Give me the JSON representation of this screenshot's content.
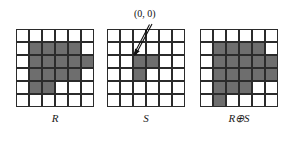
{
  "figure": {
    "background_color": "#ffffff",
    "fill_color": "#6e6e6e",
    "empty_color": "#ffffff",
    "line_color": "#2b2b2b",
    "cell_size": 13,
    "grid_rows": 6,
    "grid_cols": 6
  },
  "annotation": {
    "origin_text": "(0, 0)",
    "arrow_from_x": 152,
    "arrow_from_y": 24,
    "arrow_to_x": 134,
    "arrow_to_y": 56
  },
  "panels": [
    {
      "id": "panel-R",
      "label": "R",
      "left": 16,
      "top": 29,
      "grid": [
        [
          0,
          0,
          0,
          0,
          0,
          0
        ],
        [
          0,
          1,
          1,
          1,
          1,
          0
        ],
        [
          0,
          1,
          1,
          1,
          1,
          1
        ],
        [
          0,
          1,
          1,
          1,
          1,
          0
        ],
        [
          0,
          1,
          1,
          0,
          0,
          0
        ],
        [
          0,
          0,
          0,
          0,
          0,
          0
        ]
      ]
    },
    {
      "id": "panel-S",
      "label": "S",
      "left": 107,
      "top": 29,
      "grid": [
        [
          0,
          0,
          0,
          0,
          0,
          0
        ],
        [
          0,
          0,
          0,
          0,
          0,
          0
        ],
        [
          0,
          0,
          1,
          1,
          0,
          0
        ],
        [
          0,
          0,
          1,
          0,
          0,
          0
        ],
        [
          0,
          0,
          0,
          0,
          0,
          0
        ],
        [
          0,
          0,
          0,
          0,
          0,
          0
        ]
      ]
    },
    {
      "id": "panel-RS",
      "label": "R⊕S",
      "left": 200,
      "top": 29,
      "grid": [
        [
          0,
          0,
          0,
          0,
          0,
          0
        ],
        [
          0,
          1,
          1,
          1,
          1,
          0
        ],
        [
          0,
          1,
          1,
          1,
          1,
          1
        ],
        [
          0,
          1,
          1,
          1,
          1,
          1
        ],
        [
          0,
          1,
          1,
          1,
          0,
          0
        ],
        [
          0,
          1,
          0,
          0,
          0,
          0
        ]
      ]
    }
  ]
}
